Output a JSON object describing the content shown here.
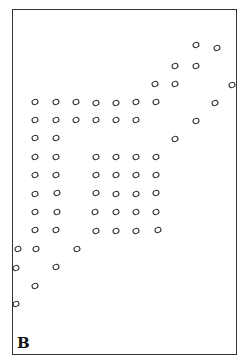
{
  "panel": {
    "label": "B",
    "border_color": "#333333",
    "dot_color": "#222222"
  },
  "dots": [
    [
      196,
      45
    ],
    [
      217,
      48
    ],
    [
      175,
      66
    ],
    [
      196,
      66
    ],
    [
      155,
      84
    ],
    [
      175,
      84
    ],
    [
      232,
      85
    ],
    [
      35,
      102
    ],
    [
      56,
      102
    ],
    [
      76,
      102
    ],
    [
      96,
      103
    ],
    [
      116,
      103
    ],
    [
      136,
      102
    ],
    [
      156,
      102
    ],
    [
      215,
      103
    ],
    [
      35,
      120
    ],
    [
      56,
      120
    ],
    [
      76,
      120
    ],
    [
      96,
      120
    ],
    [
      116,
      120
    ],
    [
      136,
      120
    ],
    [
      196,
      121
    ],
    [
      35,
      138
    ],
    [
      56,
      138
    ],
    [
      175,
      139
    ],
    [
      35,
      157
    ],
    [
      56,
      157
    ],
    [
      96,
      157
    ],
    [
      116,
      157
    ],
    [
      136,
      157
    ],
    [
      156,
      157
    ],
    [
      35,
      175
    ],
    [
      56,
      175
    ],
    [
      96,
      175
    ],
    [
      116,
      175
    ],
    [
      136,
      175
    ],
    [
      156,
      175
    ],
    [
      35,
      194
    ],
    [
      57,
      193
    ],
    [
      96,
      193
    ],
    [
      116,
      194
    ],
    [
      136,
      194
    ],
    [
      156,
      193
    ],
    [
      35,
      212
    ],
    [
      57,
      212
    ],
    [
      95,
      212
    ],
    [
      116,
      212
    ],
    [
      136,
      212
    ],
    [
      156,
      212
    ],
    [
      35,
      230
    ],
    [
      56,
      230
    ],
    [
      96,
      231
    ],
    [
      116,
      231
    ],
    [
      136,
      231
    ],
    [
      158,
      230
    ],
    [
      18,
      249
    ],
    [
      36,
      249
    ],
    [
      77,
      249
    ],
    [
      16,
      268
    ],
    [
      56,
      267
    ],
    [
      35,
      286
    ],
    [
      16,
      304
    ]
  ]
}
